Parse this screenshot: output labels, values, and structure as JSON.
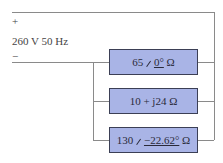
{
  "source": {
    "plus": "+",
    "minus": "−",
    "label": "260 V 50 Hz"
  },
  "branches": [
    {
      "magnitude": "65",
      "angle": "0°",
      "unit": "Ω",
      "form": "polar"
    },
    {
      "text": "10 + j24 Ω",
      "form": "rectangular"
    },
    {
      "magnitude": "130",
      "angle": "−22.62°",
      "unit": "Ω",
      "form": "polar"
    }
  ],
  "colors": {
    "box_fill": "#a9b4e6",
    "box_border": "#3b3f55",
    "wire": "#8a8a8a"
  }
}
